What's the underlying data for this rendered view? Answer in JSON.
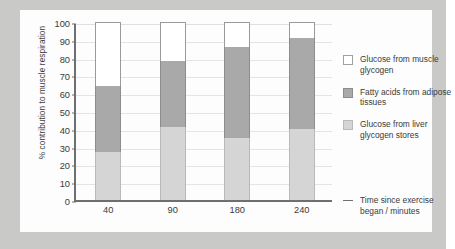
{
  "chart_data": {
    "type": "bar",
    "subtype": "stacked-bar",
    "title": "",
    "xlabel": "Time since exercise began / minutes",
    "ylabel": "% contribution to muscle respiration",
    "categories": [
      "40",
      "90",
      "180",
      "240"
    ],
    "ylim": [
      0,
      100
    ],
    "yticks": [
      0,
      10,
      20,
      30,
      40,
      50,
      60,
      70,
      80,
      90,
      100
    ],
    "ytick_labels": [
      "0",
      "10",
      "20",
      "30",
      "40",
      "50",
      "60",
      "70",
      "80",
      "90",
      "100"
    ],
    "grid": true,
    "legend_position": "right",
    "series": [
      {
        "name": "Glucose from liver glycogen stores",
        "color": "#d5d5d5",
        "values": [
          27,
          41,
          35,
          40
        ]
      },
      {
        "name": "Fatty acids from adipose tissues",
        "color": "#a9a9a9",
        "values": [
          37,
          37,
          51,
          51
        ]
      },
      {
        "name": "Glucose from muscle glycogen",
        "color": "#ffffff",
        "values": [
          36,
          22,
          14,
          9
        ]
      }
    ],
    "cumulative_tops": {
      "liver": [
        27,
        41,
        35,
        40
      ],
      "fatty": [
        64,
        78,
        86,
        91
      ],
      "muscle": [
        100,
        100,
        100,
        100
      ]
    }
  },
  "legend": {
    "items": [
      {
        "label": "Glucose from muscle glycogen",
        "swatch": "white-swatch",
        "color": "#ffffff"
      },
      {
        "label": "Fatty acids from adipose tissues",
        "swatch": "dark-grey-swatch",
        "color": "#a9a9a9"
      },
      {
        "label": "Glucose from liver glycogen stores",
        "swatch": "light-grey-swatch",
        "color": "#d5d5d5"
      }
    ]
  },
  "axes": {
    "y_title": "% contribution to muscle respiration",
    "x_title": "Time since exercise began / minutes"
  },
  "colors": {
    "page_background": "#c9c9c7",
    "card_background": "#fdfdfd",
    "axis": "#6f6f6f",
    "gridline": "#e4e4e4",
    "text": "#3b3b3b"
  }
}
